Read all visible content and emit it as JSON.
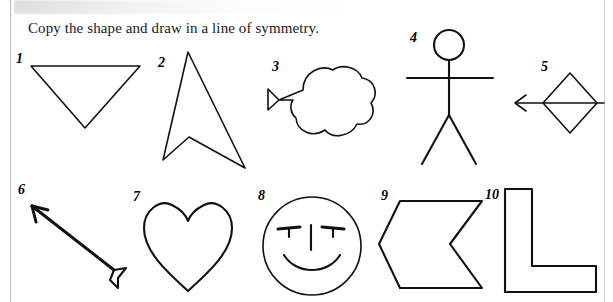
{
  "worksheet": {
    "title": "Copy the shape and draw in a line of symmetry.",
    "ink_color": "#111111",
    "page_color": "#ffffff",
    "rule_color": "#b9b9bd"
  },
  "shapes": [
    {
      "number": "1",
      "name": "inverted-triangle",
      "description": "Triangle pointing downwards"
    },
    {
      "number": "2",
      "name": "upward-arrowhead",
      "description": "Concave arrowhead / chevron pointing up"
    },
    {
      "number": "3",
      "name": "cloud-with-funnel",
      "description": "Three-lobed cloud shape with a horn on the left"
    },
    {
      "number": "4",
      "name": "stick-figure",
      "description": "Stick person with round head, straight arms and legs"
    },
    {
      "number": "5",
      "name": "diamond-with-arrow",
      "description": "Rhombus crossed by a horizontal arrow pointing left"
    },
    {
      "number": "6",
      "name": "diagonal-arrow",
      "description": "Arrow pointing up-left with fletching at the tail"
    },
    {
      "number": "7",
      "name": "heart",
      "description": "Heart shape"
    },
    {
      "number": "8",
      "name": "smiley-face",
      "description": "Circle face with two eyes, a nose line and a smile"
    },
    {
      "number": "9",
      "name": "left-chevron-block",
      "description": "Thick block arrow / chevron pointing left"
    },
    {
      "number": "10",
      "name": "l-shape",
      "description": "L-shaped polygon"
    }
  ]
}
